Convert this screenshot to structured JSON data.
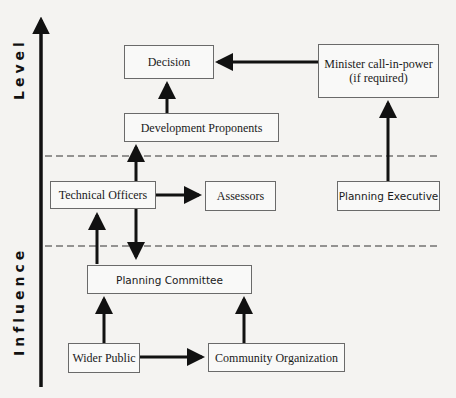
{
  "diagram": {
    "axis": {
      "top_label": "Level",
      "bottom_label": "Influence",
      "direction": "up"
    },
    "nodes": {
      "decision": "Decision",
      "minister_line1": "Minister call-in-power",
      "minister_line2": "(if required)",
      "development_proponents": "Development Proponents",
      "technical_officers": "Technical Officers",
      "assessors": "Assessors",
      "planning_executive": "Planning Executive",
      "planning_committee": "Planning Committee",
      "wider_public": "Wider Public",
      "community_organization": "Community Organization"
    },
    "edges": [
      {
        "from": "Minister call-in-power (if required)",
        "to": "Decision"
      },
      {
        "from": "Development Proponents",
        "to": "Decision"
      },
      {
        "from": "Technical Officers",
        "to": "Development Proponents"
      },
      {
        "from": "Technical Officers",
        "to": "Assessors"
      },
      {
        "from": "Technical Officers",
        "to": "Planning Committee"
      },
      {
        "from": "Planning Committee",
        "to": "Technical Officers"
      },
      {
        "from": "Planning Executive",
        "to": "Minister call-in-power (if required)"
      },
      {
        "from": "Wider Public",
        "to": "Planning Committee"
      },
      {
        "from": "Wider Public",
        "to": "Community Organization"
      },
      {
        "from": "Community Organization",
        "to": "Planning Committee"
      }
    ],
    "dividers": [
      "dashed-line-upper",
      "dashed-line-lower"
    ],
    "colors": {
      "background": "#f4f3f1",
      "box_border": "#6a6a6a",
      "arrow": "#111111"
    }
  }
}
